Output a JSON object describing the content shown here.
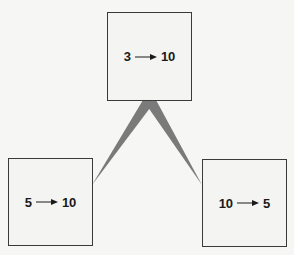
{
  "diagram": {
    "nodes": [
      {
        "id": "top",
        "from": "3",
        "to": "10"
      },
      {
        "id": "left",
        "from": "5",
        "to": "10"
      },
      {
        "id": "right",
        "from": "10",
        "to": "5"
      }
    ],
    "edges": [
      {
        "from": "top",
        "to": "left",
        "style": "tapered wedge"
      },
      {
        "from": "top",
        "to": "right",
        "style": "tapered wedge"
      }
    ],
    "icons": {
      "arrow": "right-arrow-icon"
    },
    "colors": {
      "background": "#f6f6f4",
      "box_border": "#3a3a3a",
      "wedge": "#7a7a7a",
      "text": "#1a1a1a"
    }
  }
}
